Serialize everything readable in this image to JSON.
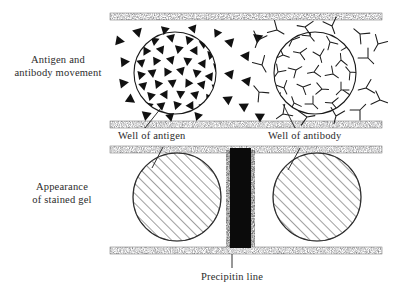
{
  "figure": {
    "labels": {
      "movement": "Antigen and\nantibody movement",
      "stained_gel": "Appearance\nof stained gel",
      "well_antigen": "Well of antigen",
      "well_antibody": "Well of antibody",
      "precipitin_line": "Precipitin line"
    },
    "colors": {
      "ink": "#231f20",
      "speckle_dark": "#3a3a3a",
      "speckle_light": "#9b9b9b",
      "precipitin_fill": "#0d0d0d",
      "background": "#ffffff",
      "hatch": "#4a4a4a"
    },
    "panels": [
      {
        "name": "movement-panel",
        "description": "Upper gel strip showing antigen triangles and antibody Y shapes diffusing outward from their wells",
        "top_edge_y": 13,
        "bottom_edge_y": 121
      },
      {
        "name": "stained-gel-panel",
        "description": "Lower gel strip showing two stained hatched wells with a dark precipitin band between them",
        "top_edge_y": 146,
        "bottom_edge_y": 247
      }
    ],
    "wells": [
      {
        "name": "antigen-well",
        "contents": "antigen",
        "marker": "filled-triangle",
        "cx": 175,
        "cy": 73,
        "r": 41,
        "panel": "movement-panel"
      },
      {
        "name": "antibody-well",
        "contents": "antibody",
        "marker": "y-shape",
        "cx": 315,
        "cy": 73,
        "r": 41,
        "panel": "movement-panel"
      },
      {
        "name": "stained-antigen-well",
        "contents": "stained gel",
        "marker": "diagonal-hatch",
        "cx": 177,
        "cy": 197,
        "r": 44,
        "panel": "stained-gel-panel"
      },
      {
        "name": "stained-antibody-well",
        "contents": "stained gel",
        "marker": "diagonal-hatch",
        "cx": 317,
        "cy": 197,
        "r": 44,
        "panel": "stained-gel-panel"
      }
    ],
    "precipitin_band": {
      "name": "precipitin-band",
      "x": 230,
      "y": 146,
      "width": 21,
      "height": 101
    },
    "strip": {
      "x_left": 110,
      "x_right": 382,
      "bar_height": 7
    }
  }
}
